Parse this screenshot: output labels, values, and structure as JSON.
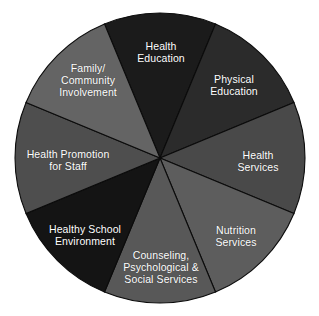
{
  "figure": {
    "background_color": "#ffffff",
    "shape": "circle",
    "center_x": 160,
    "center_y": 158,
    "radius": 145,
    "divider_color": "#0b0b0b",
    "label_color": "#ffffff"
  },
  "chart_data": {
    "type": "pie",
    "title": "",
    "subtitle": "",
    "xlabel": "",
    "ylabel": "",
    "legend_position": "none",
    "grid": false,
    "labels_inside_slices": true,
    "total_slices": 8,
    "equal_slices": true,
    "slice_angle_degrees": 45,
    "start_angle_degrees": -22.5,
    "categories": [
      "Health Education",
      "Physical Education",
      "Health Services",
      "Nutrition Services",
      "Counseling, Psychological & Social Services",
      "Healthy School Environment",
      "Health Promotion for Staff",
      "Family/Community Involvement"
    ],
    "values": [
      12.5,
      12.5,
      12.5,
      12.5,
      12.5,
      12.5,
      12.5,
      12.5
    ],
    "colors": [
      "#1b1b1b",
      "#2b2b2b",
      "#494949",
      "#5d5d5d",
      "#585858",
      "#141414",
      "#4e4e4e",
      "#646464"
    ],
    "slices": [
      {
        "name": "health-education",
        "label_lines": [
          "Health",
          "Education"
        ],
        "value": 12.5,
        "color": "#1b1b1b",
        "start_deg": -22.5,
        "end_deg": 22.5,
        "label_x": 161,
        "label_y": 52
      },
      {
        "name": "physical-education",
        "label_lines": [
          "Physical",
          "Education"
        ],
        "value": 12.5,
        "color": "#2b2b2b",
        "start_deg": 22.5,
        "end_deg": 67.5,
        "label_x": 234,
        "label_y": 85
      },
      {
        "name": "health-services",
        "label_lines": [
          "Health",
          "Services"
        ],
        "value": 12.5,
        "color": "#494949",
        "start_deg": 67.5,
        "end_deg": 112.5,
        "label_x": 258,
        "label_y": 161
      },
      {
        "name": "nutrition-services",
        "label_lines": [
          "Nutrition",
          "Services"
        ],
        "value": 12.5,
        "color": "#5d5d5d",
        "start_deg": 112.5,
        "end_deg": 157.5,
        "label_x": 236,
        "label_y": 236
      },
      {
        "name": "counseling-psychological-social-services",
        "label_lines": [
          "Counseling,",
          "Psychological &",
          "Social Services"
        ],
        "value": 12.5,
        "color": "#585858",
        "start_deg": 157.5,
        "end_deg": 202.5,
        "label_x": 161,
        "label_y": 267
      },
      {
        "name": "healthy-school-environment",
        "label_lines": [
          "Healthy School",
          "Environment"
        ],
        "value": 12.5,
        "color": "#141414",
        "start_deg": 202.5,
        "end_deg": 247.5,
        "label_x": 85,
        "label_y": 235
      },
      {
        "name": "health-promotion-for-staff",
        "label_lines": [
          "Health Promotion",
          "for Staff"
        ],
        "value": 12.5,
        "color": "#4e4e4e",
        "start_deg": 247.5,
        "end_deg": 292.5,
        "label_x": 68,
        "label_y": 160
      },
      {
        "name": "family-community-involvement",
        "label_lines": [
          "Family/",
          "Community",
          "Involvement"
        ],
        "value": 12.5,
        "color": "#646464",
        "start_deg": 292.5,
        "end_deg": 337.5,
        "label_x": 88,
        "label_y": 80
      }
    ]
  }
}
